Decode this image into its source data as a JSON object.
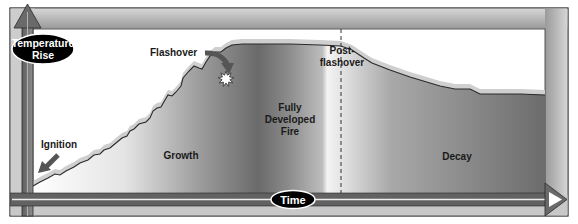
{
  "axes": {
    "y_label_line1": "Temperature",
    "y_label_line2": "Rise",
    "x_label": "Time"
  },
  "stages": {
    "ignition": "Ignition",
    "growth": "Growth",
    "flashover": "Flashover",
    "fully_developed_line1": "Fully",
    "fully_developed_line2": "Developed",
    "fully_developed_line3": "Fire",
    "post_flashover_line1": "Post-",
    "post_flashover_line2": "flashover",
    "decay": "Decay"
  },
  "colors": {
    "frame": "#b8b8b8",
    "frame_dark": "#6e6e6e",
    "axis_arrow": "#7a7a7a",
    "curve_fill_light": "#f2f2f2",
    "curve_fill_dark": "#6c6c6c",
    "curve_glow": "#cfcfcf",
    "pill": "#000000"
  }
}
